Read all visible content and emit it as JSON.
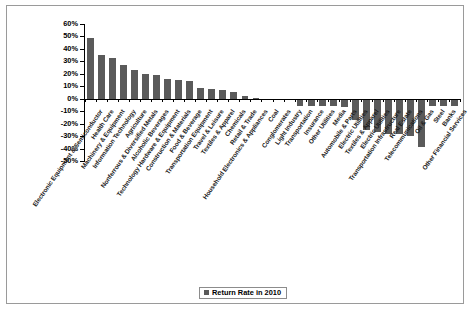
{
  "chart_data": {
    "type": "bar",
    "title": "",
    "xlabel": "",
    "ylabel": "",
    "ylim": [
      -50,
      60
    ],
    "ytick_step": 10,
    "grid": false,
    "legend_position": "bottom-center",
    "series_color": "#5a5a5a",
    "ytick_labels": [
      "60%",
      "50%",
      "40%",
      "30%",
      "20%",
      "10%",
      "0%",
      "-10%",
      "-20%",
      "-30%",
      "-40%",
      "-50%"
    ],
    "ytick_values": [
      60,
      50,
      40,
      30,
      20,
      10,
      0,
      -10,
      -20,
      -30,
      -40,
      -50
    ],
    "legend": [
      "Return Rate in 2010"
    ],
    "categories": [
      "Electronic Equipment & Semiconductor",
      "Health Care",
      "Machinery & Equipment",
      "Information Technology",
      "Agriculture",
      "Nonferrous & Diversified Metals",
      "Alcoholic Beverages",
      "Technology Hardware & Equipment",
      "Construction & Materials",
      "Food & Beverage",
      "Transportation Equipment",
      "Travel & Leisure",
      "Textiles & Apparel",
      "Chemicals",
      "Retail & Trade",
      "Household Electronics & Appliances",
      "Coal",
      "Conglomerates",
      "Light Industry",
      "Transportation",
      "Insurance",
      "Other Utilities",
      "Media",
      "Automobile & Parts",
      "Electric Utilities",
      "Textiles & Apparel",
      "Electric Utilities",
      "Transportation Infrastructure",
      "Real Estate",
      "Telecommunications",
      "Oil & Gas",
      "Steel",
      "Banks",
      "Other Financial Services"
    ],
    "series": [
      {
        "name": "Return Rate in 2010",
        "values": [
          49,
          35,
          32.5,
          27,
          23,
          20,
          19,
          15.5,
          15,
          14,
          8.5,
          8,
          7,
          5.5,
          2,
          0.8,
          -0.3,
          -0.8,
          -1.2,
          -5.5,
          -5.5,
          -5.5,
          -5.5,
          -7,
          -17,
          -25,
          -26.5,
          -28,
          -28.5,
          -30,
          -38.5,
          -6,
          -6,
          -6
        ]
      }
    ]
  }
}
